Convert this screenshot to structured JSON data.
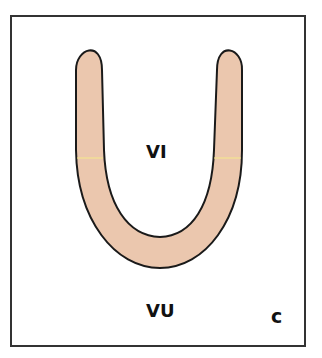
{
  "diagram": {
    "labels": {
      "inner": "VI",
      "outer": "VU",
      "panel": "c"
    },
    "colors": {
      "shape_fill": "#EBC7AE",
      "shape_stroke": "#1A1A1A",
      "frame_stroke": "#333333",
      "background": "#FFFFFF",
      "highlight_line": "#F5E98A"
    }
  }
}
